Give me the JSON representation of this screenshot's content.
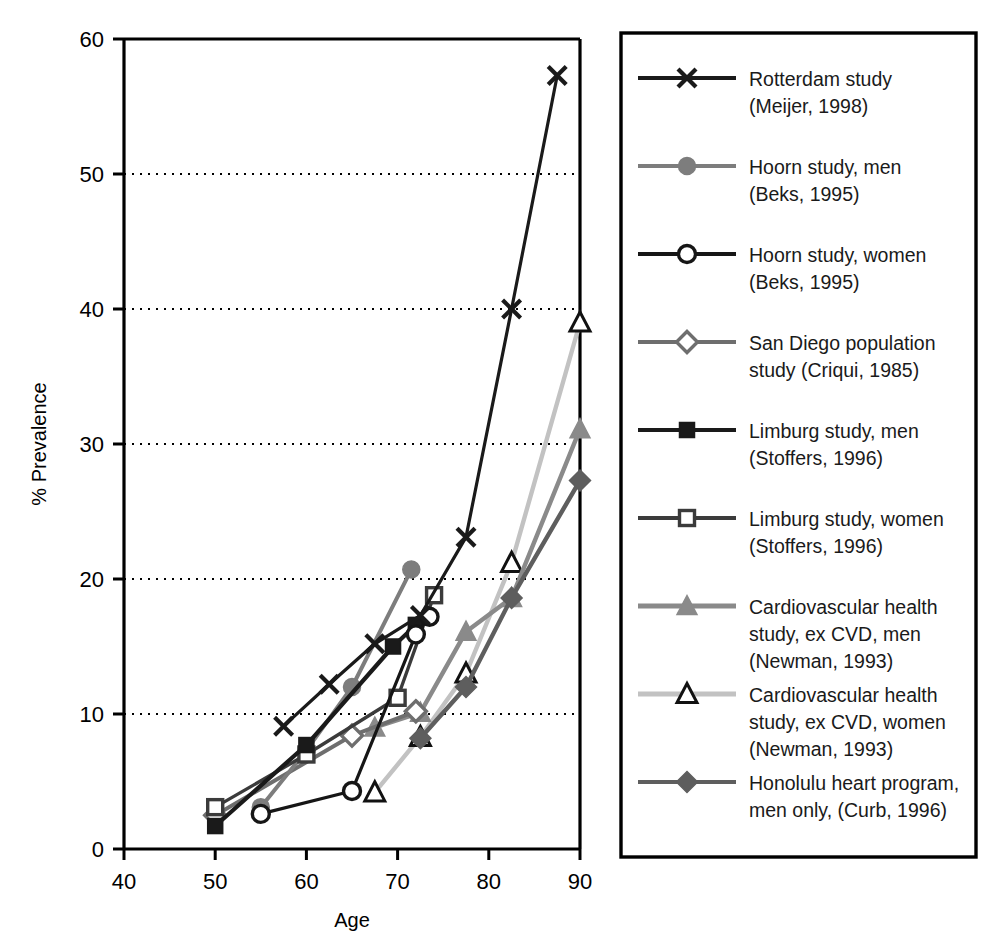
{
  "chart_data": {
    "type": "line",
    "title": "",
    "xlabel": "Age",
    "ylabel": "% Prevalence",
    "xlim": [
      40,
      90
    ],
    "ylim": [
      0,
      60
    ],
    "xticks": [
      40,
      50,
      60,
      70,
      80,
      90
    ],
    "yticks": [
      0,
      10,
      20,
      30,
      40,
      50,
      60
    ],
    "grid": "horizontal-dotted",
    "legend_position": "right",
    "series": [
      {
        "name": "Rotterdam study (Meijer, 1998)",
        "label_line1": "Rotterdam study",
        "label_line2": "(Meijer, 1998)",
        "marker": "x-cross",
        "color": "#1a1a1a",
        "linewidth": 3.2,
        "points": [
          [
            57.5,
            9.1
          ],
          [
            62.5,
            12.2
          ],
          [
            67.5,
            15.2
          ],
          [
            72.5,
            17.3
          ],
          [
            77.5,
            23.1
          ],
          [
            82.5,
            40.0
          ],
          [
            87.5,
            57.3
          ]
        ]
      },
      {
        "name": "Hoorn study, men (Beks, 1995)",
        "label_line1": "Hoorn study, men",
        "label_line2": "(Beks, 1995)",
        "marker": "filled-circle",
        "color": "#7d7d7d",
        "linewidth": 4.0,
        "points": [
          [
            55.0,
            3.1
          ],
          [
            60.0,
            7.3
          ],
          [
            65.0,
            12.0
          ],
          [
            71.5,
            20.7
          ]
        ]
      },
      {
        "name": "Hoorn study, women (Beks, 1995)",
        "label_line1": "Hoorn study, women",
        "label_line2": "(Beks, 1995)",
        "marker": "open-circle",
        "color": "#161616",
        "linewidth": 3.2,
        "points": [
          [
            55.0,
            2.6
          ],
          [
            65.0,
            4.3
          ],
          [
            72.0,
            15.9
          ],
          [
            73.5,
            17.2
          ]
        ]
      },
      {
        "name": "San Diego population study (Criqui, 1985)",
        "label_line1": "San Diego population",
        "label_line2": "study (Criqui, 1985)",
        "marker": "open-diamond",
        "color": "#6e6e6e",
        "linewidth": 4.0,
        "points": [
          [
            50.0,
            2.5
          ],
          [
            65.0,
            8.4
          ],
          [
            72.0,
            10.2
          ]
        ]
      },
      {
        "name": "Limburg study, men (Stoffers, 1996)",
        "label_line1": "Limburg study, men",
        "label_line2": "(Stoffers, 1996)",
        "marker": "filled-square",
        "color": "#1a1a1a",
        "linewidth": 4.2,
        "points": [
          [
            50.0,
            1.7
          ],
          [
            60.0,
            7.7
          ],
          [
            69.5,
            15.0
          ],
          [
            72.0,
            16.6
          ]
        ]
      },
      {
        "name": "Limburg study, women (Stoffers, 1996)",
        "label_line1": "Limburg study, women",
        "label_line2": "(Stoffers, 1996)",
        "marker": "open-square",
        "color": "#3b3b3b",
        "linewidth": 3.4,
        "points": [
          [
            50.0,
            3.1
          ],
          [
            60.0,
            7.0
          ],
          [
            70.0,
            11.2
          ],
          [
            74.0,
            18.8
          ]
        ]
      },
      {
        "name": "Cardiovascular health study, ex CVD, men (Newman, 1993)",
        "label_line1": "Cardiovascular health",
        "label_line2": "study, ex CVD, men",
        "label_line3": "(Newman, 1993)",
        "marker": "filled-triangle",
        "color": "#8a8a8a",
        "linewidth": 4.4,
        "points": [
          [
            67.5,
            9.0
          ],
          [
            72.5,
            10.1
          ],
          [
            77.5,
            16.1
          ],
          [
            82.5,
            18.6
          ],
          [
            90.0,
            31.1
          ]
        ]
      },
      {
        "name": "Cardiovascular health study, ex CVD, women (Newman, 1993)",
        "label_line1": "Cardiovascular health",
        "label_line2": "study, ex CVD, women",
        "label_line3": "(Newman, 1993)",
        "marker": "open-triangle",
        "color": "#c2c2c2",
        "linewidth": 4.4,
        "points": [
          [
            67.5,
            4.2
          ],
          [
            72.5,
            8.3
          ],
          [
            77.5,
            13.0
          ],
          [
            82.5,
            21.2
          ],
          [
            90.0,
            39.0
          ]
        ]
      },
      {
        "name": "Honolulu heart program, men only, (Curb, 1996)",
        "label_line1": "Honolulu heart program,",
        "label_line2": "men only, (Curb, 1996)",
        "marker": "filled-diamond",
        "color": "#5e5e5e",
        "linewidth": 4.4,
        "points": [
          [
            72.5,
            8.2
          ],
          [
            77.5,
            12.0
          ],
          [
            82.5,
            18.6
          ],
          [
            90.0,
            27.3
          ]
        ]
      }
    ]
  },
  "legend": {
    "border_color": "#000000",
    "entries": [
      {
        "label_line1": "Rotterdam study",
        "label_line2": "(Meijer, 1998)",
        "label_line3": "",
        "marker": "x-cross",
        "color": "#1a1a1a"
      },
      {
        "label_line1": "Hoorn study, men",
        "label_line2": "(Beks, 1995)",
        "label_line3": "",
        "marker": "filled-circle",
        "color": "#7d7d7d"
      },
      {
        "label_line1": "Hoorn study, women",
        "label_line2": "(Beks, 1995)",
        "label_line3": "",
        "marker": "open-circle",
        "color": "#161616"
      },
      {
        "label_line1": "San Diego population",
        "label_line2": "study (Criqui, 1985)",
        "label_line3": "",
        "marker": "open-diamond",
        "color": "#6e6e6e"
      },
      {
        "label_line1": "Limburg study, men",
        "label_line2": "(Stoffers, 1996)",
        "label_line3": "",
        "marker": "filled-square",
        "color": "#1a1a1a"
      },
      {
        "label_line1": "Limburg study, women",
        "label_line2": "(Stoffers, 1996)",
        "label_line3": "",
        "marker": "open-square",
        "color": "#3b3b3b"
      },
      {
        "label_line1": "Cardiovascular health",
        "label_line2": "study, ex CVD, men",
        "label_line3": "(Newman, 1993)",
        "marker": "filled-triangle",
        "color": "#8a8a8a"
      },
      {
        "label_line1": "Cardiovascular health",
        "label_line2": "study, ex CVD, women",
        "label_line3": "(Newman, 1993)",
        "marker": "open-triangle",
        "color": "#c2c2c2"
      },
      {
        "label_line1": "Honolulu heart program,",
        "label_line2": "men only, (Curb, 1996)",
        "label_line3": "",
        "marker": "filled-diamond",
        "color": "#5e5e5e"
      }
    ]
  }
}
